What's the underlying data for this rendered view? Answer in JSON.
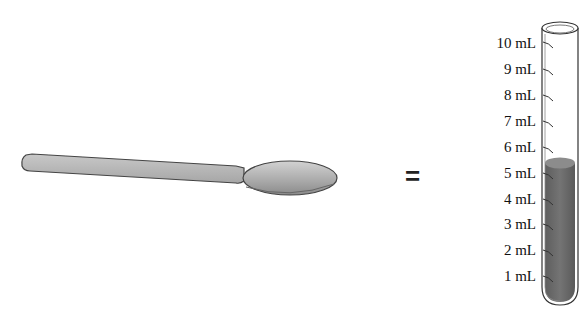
{
  "diagram": {
    "equals_sign": "=",
    "spoon": {
      "label": "spoon",
      "fill_color": "#b8b8b8",
      "outline_color": "#444444"
    },
    "test_tube": {
      "fill_level_ml": 5,
      "liquid_color": "#6e6e6e",
      "scale": [
        {
          "value": 10,
          "label": "10 mL"
        },
        {
          "value": 9,
          "label": "9 mL"
        },
        {
          "value": 8,
          "label": "8 mL"
        },
        {
          "value": 7,
          "label": "7 mL"
        },
        {
          "value": 6,
          "label": "6 mL"
        },
        {
          "value": 5,
          "label": "5 mL"
        },
        {
          "value": 4,
          "label": "4 mL"
        },
        {
          "value": 3,
          "label": "3 mL"
        },
        {
          "value": 2,
          "label": "2 mL"
        },
        {
          "value": 1,
          "label": "1 mL"
        }
      ]
    }
  }
}
